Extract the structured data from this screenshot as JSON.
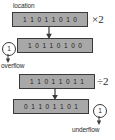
{
  "diagram": {
    "title_label": "location",
    "rows": [
      {
        "name": "source-register-multiply",
        "bits": [
          "1",
          "1",
          "0",
          "1",
          "1",
          "0",
          "1",
          "0"
        ],
        "operator": "×2"
      },
      {
        "name": "result-register-multiply",
        "bits": [
          "1",
          "0",
          "1",
          "1",
          "0",
          "1",
          "0",
          "0"
        ],
        "operator": ""
      },
      {
        "name": "source-register-divide",
        "bits": [
          "1",
          "1",
          "0",
          "1",
          "1",
          "0",
          "1",
          "1"
        ],
        "operator": "÷2"
      },
      {
        "name": "result-register-divide",
        "bits": [
          "0",
          "1",
          "1",
          "0",
          "1",
          "1",
          "0",
          "1"
        ],
        "operator": ""
      }
    ],
    "overflow": {
      "carry_bit": "1",
      "label": "overflow"
    },
    "underflow": {
      "carry_bit": "1",
      "label": "underflow"
    },
    "colors": {
      "register_fill": "#a8a8a8",
      "register_border": "#3a3a3a",
      "text": "#1d1d1d",
      "background": "#ffffff"
    }
  }
}
